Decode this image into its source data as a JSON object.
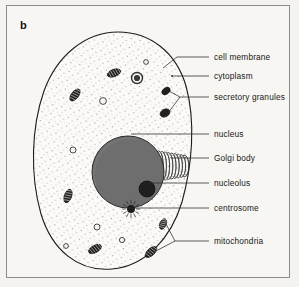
{
  "figure": {
    "panel_label": "b",
    "kind": "animal-cell-diagram",
    "background_color": "#f4f3ef",
    "frame_color": "#8d8d8d",
    "ink_color": "#171717",
    "nucleus_fill": "#6e6e6e",
    "nucleolus_fill": "#201f1f",
    "cytoplasm_fill": "#faf9f6",
    "organelle_fill": "#221f1f"
  },
  "labels": [
    {
      "id": "cell-membrane",
      "text": "cell membrane",
      "x": 214,
      "y": 53,
      "leader_x1": 209,
      "leader_y1": 57,
      "leader_x2": 177,
      "leader_y2": 57,
      "target_x": 163,
      "target_y": 68
    },
    {
      "id": "cytoplasm",
      "text": "cytoplasm",
      "x": 214,
      "y": 72,
      "leader_x1": 209,
      "leader_y1": 76,
      "leader_x2": 172,
      "leader_y2": 76,
      "target_x": 172,
      "target_y": 76
    },
    {
      "id": "secretory-granules",
      "text": "secretory granules",
      "x": 214,
      "y": 93,
      "leader_x1": 209,
      "leader_y1": 97,
      "leader_x2": 180,
      "leader_y2": 97,
      "target_x": 180,
      "target_y": 97
    },
    {
      "id": "nucleus",
      "text": "nucleus",
      "x": 214,
      "y": 130,
      "leader_x1": 209,
      "leader_y1": 134,
      "leader_x2": 131,
      "leader_y2": 134,
      "target_x": 131,
      "target_y": 134
    },
    {
      "id": "golgi-body",
      "text": "Golgi body",
      "x": 214,
      "y": 154,
      "leader_x1": 209,
      "leader_y1": 158,
      "leader_x2": 171,
      "leader_y2": 158,
      "target_x": 171,
      "target_y": 158
    },
    {
      "id": "nucleolus",
      "text": "nucleolus",
      "x": 214,
      "y": 179,
      "leader_x1": 209,
      "leader_y1": 183,
      "leader_x2": 148,
      "leader_y2": 183,
      "target_x": 148,
      "target_y": 183
    },
    {
      "id": "centrosome",
      "text": "centrosome",
      "x": 214,
      "y": 204,
      "leader_x1": 209,
      "leader_y1": 208,
      "leader_x2": 134,
      "leader_y2": 208,
      "target_x": 134,
      "target_y": 208
    },
    {
      "id": "mitochondria",
      "text": "mitochondria",
      "x": 214,
      "y": 237,
      "leader_x1": 209,
      "leader_y1": 241,
      "leader_x2": 175,
      "leader_y2": 241,
      "target_x": 175,
      "target_y": 241
    }
  ],
  "structures": {
    "cell_membrane_path": "M 118 32 C 150 32 176 52 186 86 C 196 122 192 166 182 202 C 171 238 146 266 112 269 C 78 272 52 250 41 214 C 30 176 31 128 44 91 C 57 55 86 32 118 32 Z",
    "nucleus": {
      "cx": 128,
      "cy": 172,
      "r": 36
    },
    "nucleolus": {
      "cx": 147,
      "cy": 189,
      "r": 8
    },
    "golgi": {
      "cx": 172,
      "cy": 166,
      "stacks": 9
    },
    "centrosome": {
      "cx": 131,
      "cy": 209,
      "r": 4,
      "rays": 12
    },
    "mitochondria": [
      {
        "cx": 75,
        "cy": 95,
        "rx": 7,
        "ry": 3.6,
        "rot": -52
      },
      {
        "cx": 114,
        "cy": 73,
        "rx": 7,
        "ry": 3.6,
        "rot": -20
      },
      {
        "cx": 68,
        "cy": 196,
        "rx": 7,
        "ry": 3.6,
        "rot": -70
      },
      {
        "cx": 95,
        "cy": 249,
        "rx": 7,
        "ry": 3.6,
        "rot": -28
      },
      {
        "cx": 163,
        "cy": 224,
        "rx": 5.5,
        "ry": 3.2,
        "rot": -66
      },
      {
        "cx": 151,
        "cy": 252,
        "rx": 7,
        "ry": 3.6,
        "rot": -42
      }
    ],
    "secretory_granules": [
      {
        "cx": 166,
        "cy": 91,
        "rx": 4.6,
        "ry": 3.2,
        "rot": -38
      },
      {
        "cx": 165,
        "cy": 113,
        "rx": 5.2,
        "ry": 3.8,
        "rot": -28
      }
    ],
    "vesicles": [
      {
        "cx": 137,
        "cy": 78,
        "r": 5.5,
        "ring": true
      },
      {
        "cx": 103,
        "cy": 101,
        "r": 3.4,
        "ring": true
      },
      {
        "cx": 73,
        "cy": 150,
        "r": 3.0,
        "ring": true
      },
      {
        "cx": 97,
        "cy": 227,
        "r": 3.0,
        "ring": true
      },
      {
        "cx": 122,
        "cy": 240,
        "r": 2.6,
        "ring": true
      },
      {
        "cx": 146,
        "cy": 62,
        "r": 2.4,
        "ring": true
      },
      {
        "cx": 66,
        "cy": 246,
        "r": 2.4,
        "ring": true
      }
    ]
  }
}
